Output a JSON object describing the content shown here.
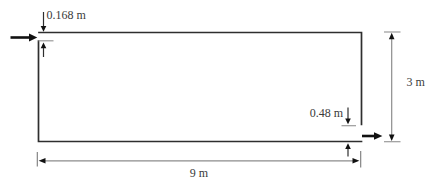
{
  "diagram": {
    "labels": {
      "inlet_thickness": "0.168 m",
      "outlet_thickness": "0.48 m",
      "height": "3 m",
      "length": "9 m"
    },
    "colors": {
      "background": "#ffffff",
      "outline": "#2e2e2e",
      "dimension_line": "#8c8c8c",
      "arrowhead": "#111111",
      "label_text": "#3a3a3a"
    }
  }
}
